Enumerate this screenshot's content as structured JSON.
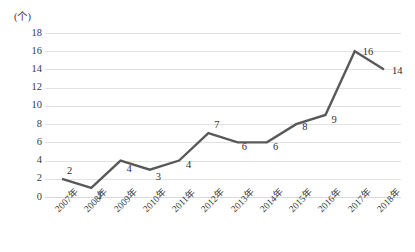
{
  "chart_data": {
    "type": "line",
    "title": "",
    "subtitle": "",
    "xlabel": "",
    "ylabel": "",
    "unit_label": "(个)",
    "categories": [
      "2007年",
      "2008年",
      "2009年",
      "2010年",
      "2011年",
      "2012年",
      "2013年",
      "2014年",
      "2015年",
      "2016年",
      "2017年",
      "2018年"
    ],
    "values": [
      2,
      1,
      4,
      3,
      4,
      7,
      6,
      6,
      8,
      9,
      16,
      14
    ],
    "data_labels": [
      "2",
      "1",
      "4",
      "3",
      "4",
      "7",
      "6",
      "6",
      "8",
      "9",
      "16",
      "14"
    ],
    "ytick_labels": [
      "18",
      "16",
      "14",
      "12",
      "10",
      "8",
      "6",
      "4",
      "2",
      "0"
    ],
    "yticks": [
      18,
      16,
      14,
      12,
      10,
      8,
      6,
      4,
      2,
      0
    ],
    "ylim": [
      0,
      18
    ],
    "ystep": 2,
    "grid": true,
    "legend": "none",
    "series_color": "#595959",
    "gridline_color": "#e2e2e2",
    "background_color": "#ffffff",
    "text_color": "#3b3b3b"
  }
}
